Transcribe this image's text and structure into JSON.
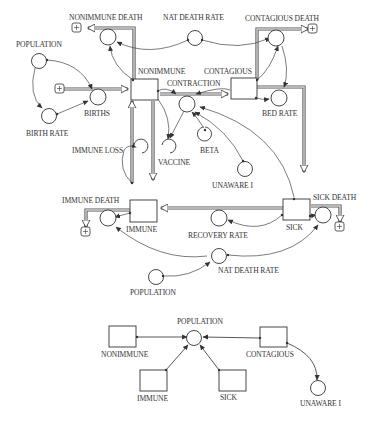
{
  "diagram": {
    "type": "system-dynamics stock-and-flow",
    "main_model": {
      "stocks": [
        {
          "id": "nonimmune",
          "label": "NONIMMUNE"
        },
        {
          "id": "contagious",
          "label": "CONTAGIOUS"
        },
        {
          "id": "immune",
          "label": "IMMUNE"
        },
        {
          "id": "sick",
          "label": "SICK"
        }
      ],
      "flows": [
        {
          "id": "births",
          "label": "BIRTHS"
        },
        {
          "id": "nonimmune_death",
          "label": "NONIMMUNE DEATH"
        },
        {
          "id": "contraction",
          "label": "CONTRACTION"
        },
        {
          "id": "contagious_death",
          "label": "CONTAGIOUS DEATH"
        },
        {
          "id": "bed_rate",
          "label": "BED RATE"
        },
        {
          "id": "immune_loss",
          "label": "IMMUNE LOSS"
        },
        {
          "id": "vaccine",
          "label": "VACCINE"
        },
        {
          "id": "immune_death",
          "label": "IMMUNE DEATH"
        },
        {
          "id": "recovery_rate",
          "label": "RECOVERY RATE"
        },
        {
          "id": "sick_death",
          "label": "SICK DEATH"
        }
      ],
      "auxiliaries": [
        {
          "id": "population_top",
          "label": "POPULATION"
        },
        {
          "id": "birth_rate",
          "label": "BIRTH RATE"
        },
        {
          "id": "nat_death_rate_top",
          "label": "NAT DEATH RATE"
        },
        {
          "id": "beta",
          "label": "BETA"
        },
        {
          "id": "unaware_i",
          "label": "UNAWARE I"
        },
        {
          "id": "nat_death_rate_bottom",
          "label": "NAT DEATH RATE"
        },
        {
          "id": "population_bottom",
          "label": "POPULATION"
        }
      ]
    },
    "sub_model": {
      "stocks": [
        {
          "id": "nonimmune",
          "label": "NONIMMUNE"
        },
        {
          "id": "contagious",
          "label": "CONTAGIOUS"
        },
        {
          "id": "immune",
          "label": "IMMUNE"
        },
        {
          "id": "sick",
          "label": "SICK"
        }
      ],
      "auxiliaries": [
        {
          "id": "population",
          "label": "POPULATION"
        },
        {
          "id": "unaware_i",
          "label": "UNAWARE I"
        }
      ]
    }
  }
}
